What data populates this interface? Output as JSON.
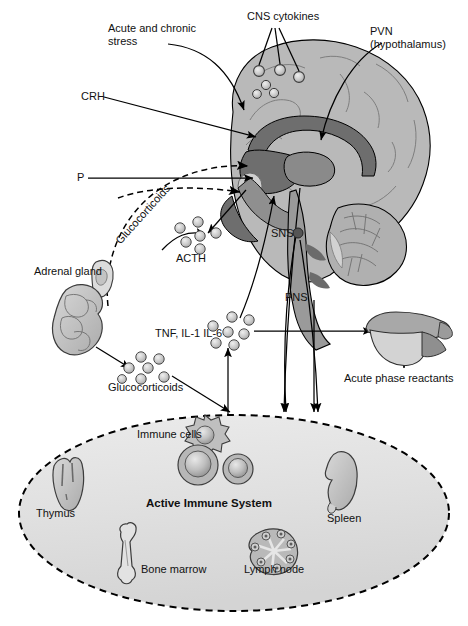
{
  "figure": {
    "type": "biomedical-schematic",
    "background": "#ffffff"
  },
  "colors": {
    "brain_light": "#b9b9b9",
    "brain_mid": "#9a9a9a",
    "brain_dark": "#6e6e6e",
    "organ_fill": "#bdbdbd",
    "organ_light": "#d6d6d6",
    "dot_fill": "#c9c9c9",
    "dot_stroke": "#4a4a4a",
    "sns_dot": "#555555",
    "ellipse_fill": "#e3e3e3",
    "stroke": "#000000"
  },
  "labels": {
    "acute_chronic_stress": "Acute and chronic\nstress",
    "cns_cytokines": "CNS cytokines",
    "pvn": "PVN\n(hypothalamus)",
    "crh": "CRH",
    "p": "P",
    "glucocorticoids_feedback": "Glucocorticoids",
    "acth": "ACTH",
    "adrenal_gland": "Adrenal gland",
    "sns": "SNS",
    "pns": "PNS",
    "cytokines": "TNF, IL-1 IL-6",
    "glucocorticoids": "Glucocorticoids",
    "acute_phase_reactants": "Acute phase reactants",
    "immune_cells": "Immune cells",
    "active_immune_system": "Active Immune System",
    "thymus": "Thymus",
    "spleen": "Spleen",
    "bone_marrow": "Bone marrow",
    "lymph_node": "Lymph node"
  },
  "structures": [
    {
      "name": "brain",
      "label": null
    },
    {
      "name": "cerebellum",
      "label": null
    },
    {
      "name": "brainstem",
      "label": null
    },
    {
      "name": "adrenal-gland",
      "label": "Adrenal gland"
    },
    {
      "name": "liver",
      "label": "Acute phase reactants"
    },
    {
      "name": "thymus",
      "label": "Thymus"
    },
    {
      "name": "spleen",
      "label": "Spleen"
    },
    {
      "name": "bone-marrow",
      "label": "Bone marrow"
    },
    {
      "name": "lymph-node",
      "label": "Lymph node"
    }
  ],
  "molecule_clusters": [
    {
      "name": "cns-cytokine-dots",
      "count": 6,
      "label": "CNS cytokines"
    },
    {
      "name": "acth-dots",
      "count": 6,
      "label": "ACTH"
    },
    {
      "name": "cytokine-dots",
      "count": 7,
      "label": "TNF, IL-1 IL-6"
    },
    {
      "name": "glucocorticoid-dots",
      "count": 7,
      "label": "Glucocorticoids"
    }
  ]
}
